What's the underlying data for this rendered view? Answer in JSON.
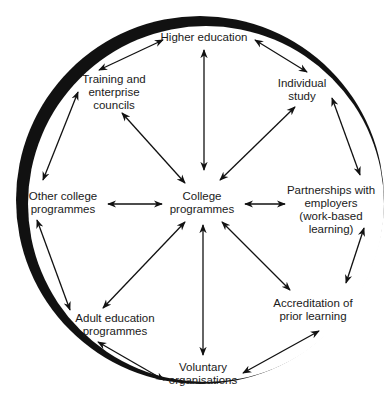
{
  "diagram": {
    "center": {
      "label_lines": [
        "College",
        "programmes"
      ],
      "x": 202,
      "y": 203
    },
    "nodes": [
      {
        "id": "higher-education",
        "label_lines": [
          "Higher education"
        ],
        "x": 204,
        "y": 37
      },
      {
        "id": "individual-study",
        "label_lines": [
          "Individual",
          "study"
        ],
        "x": 302,
        "y": 90
      },
      {
        "id": "partnerships-with-employers",
        "label_lines": [
          "Partnerships with",
          "employers",
          "(work-based",
          "learning)"
        ],
        "x": 331,
        "y": 210
      },
      {
        "id": "accreditation-of-prior-learning",
        "label_lines": [
          "Accreditation of",
          "prior learning"
        ],
        "x": 313,
        "y": 310
      },
      {
        "id": "voluntary-organisations",
        "label_lines": [
          "Voluntary",
          "organisations"
        ],
        "x": 203,
        "y": 374
      },
      {
        "id": "adult-education-programmes",
        "label_lines": [
          "Adult education",
          "programmes"
        ],
        "x": 115,
        "y": 325
      },
      {
        "id": "other-college-programmes",
        "label_lines": [
          "Other college",
          "programmes"
        ],
        "x": 63,
        "y": 203
      },
      {
        "id": "training-and-enterprise-councils",
        "label_lines": [
          "Training and",
          "enterprise",
          "councils"
        ],
        "x": 114,
        "y": 92
      }
    ],
    "circle": {
      "cx": 201,
      "cy": 201,
      "r": 180,
      "stroke": "#111111"
    }
  }
}
